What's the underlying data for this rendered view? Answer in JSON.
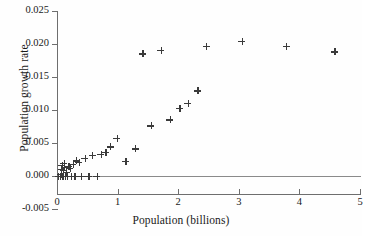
{
  "chart_data": {
    "type": "scatter",
    "title": "",
    "xlabel": "Population (billions)",
    "ylabel": "Population growth rate",
    "xlim": [
      0,
      5
    ],
    "ylim": [
      -0.005,
      0.025
    ],
    "xticks": [
      "0",
      "1",
      "2",
      "3",
      "4",
      "5"
    ],
    "xtick_values": [
      0,
      1,
      2,
      3,
      4,
      5
    ],
    "yticks": [
      "0.025",
      "0.020",
      "0.015",
      "0.010",
      "0.005",
      "0.000",
      "-0.005"
    ],
    "ytick_values": [
      0.025,
      0.02,
      0.015,
      0.01,
      0.005,
      0.0,
      -0.005
    ],
    "grid": false,
    "legend": null,
    "marker": "plus",
    "marker_color": "#3a3a3a",
    "zero_line": 0.0,
    "points": [
      {
        "x": 0.02,
        "y": 0.0
      },
      {
        "x": 0.05,
        "y": 0.0
      },
      {
        "x": 0.06,
        "y": 0.0003
      },
      {
        "x": 0.07,
        "y": 0.001
      },
      {
        "x": 0.08,
        "y": 0.0016
      },
      {
        "x": 0.09,
        "y": 0.0
      },
      {
        "x": 0.1,
        "y": 0.0008
      },
      {
        "x": 0.11,
        "y": 0.0019
      },
      {
        "x": 0.12,
        "y": 0.0013
      },
      {
        "x": 0.13,
        "y": 0.0
      },
      {
        "x": 0.15,
        "y": 0.0006
      },
      {
        "x": 0.17,
        "y": 0.0
      },
      {
        "x": 0.19,
        "y": 0.0014
      },
      {
        "x": 0.21,
        "y": 0.0011
      },
      {
        "x": 0.23,
        "y": 0.0
      },
      {
        "x": 0.26,
        "y": 0.0017
      },
      {
        "x": 0.29,
        "y": 0.0
      },
      {
        "x": 0.32,
        "y": 0.0023
      },
      {
        "x": 0.36,
        "y": 0.002
      },
      {
        "x": 0.4,
        "y": 0.0
      },
      {
        "x": 0.46,
        "y": 0.0027
      },
      {
        "x": 0.52,
        "y": 0.0
      },
      {
        "x": 0.58,
        "y": 0.0031
      },
      {
        "x": 0.66,
        "y": 0.0
      },
      {
        "x": 0.72,
        "y": 0.0033
      },
      {
        "x": 0.8,
        "y": 0.0036
      },
      {
        "x": 0.88,
        "y": 0.0044
      },
      {
        "x": 0.99,
        "y": 0.0057
      },
      {
        "x": 1.13,
        "y": 0.0022
      },
      {
        "x": 1.29,
        "y": 0.0041
      },
      {
        "x": 1.41,
        "y": 0.0185
      },
      {
        "x": 1.55,
        "y": 0.0076
      },
      {
        "x": 1.71,
        "y": 0.019
      },
      {
        "x": 1.86,
        "y": 0.0085
      },
      {
        "x": 2.02,
        "y": 0.0103
      },
      {
        "x": 2.16,
        "y": 0.011
      },
      {
        "x": 2.32,
        "y": 0.0129
      },
      {
        "x": 2.46,
        "y": 0.0196
      },
      {
        "x": 3.05,
        "y": 0.0204
      },
      {
        "x": 3.78,
        "y": 0.0196
      },
      {
        "x": 4.58,
        "y": 0.0188
      }
    ]
  }
}
